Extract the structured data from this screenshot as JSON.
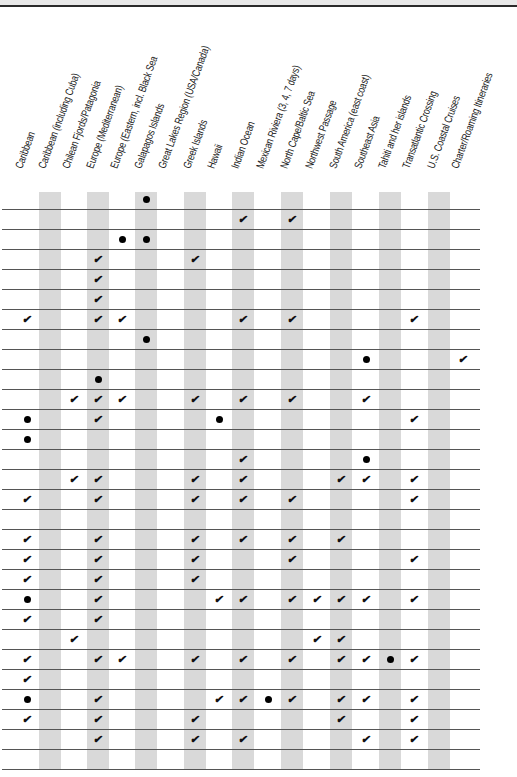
{
  "columns": [
    {
      "label": "Caribbean",
      "x": 27,
      "shaded": false
    },
    {
      "label": "Caribbean (including Cuba)",
      "x": 50,
      "shaded": true
    },
    {
      "label": "Chilean Fjords/Patagonia",
      "x": 74,
      "shaded": false
    },
    {
      "label": "Europe (Mediterranean)",
      "x": 98,
      "shaded": true
    },
    {
      "label": "Europe (Eastern, incl. Black Sea",
      "x": 122,
      "shaded": false
    },
    {
      "label": "Galapagos Islands",
      "x": 146,
      "shaded": true
    },
    {
      "label": "Great Lakes Region (USA/Canada)",
      "x": 170,
      "shaded": false
    },
    {
      "label": "Greek Islands",
      "x": 195,
      "shaded": true
    },
    {
      "label": "Hawaii",
      "x": 219,
      "shaded": false
    },
    {
      "label": "Indian Ocean",
      "x": 243,
      "shaded": true
    },
    {
      "label": "Mexican Riviera (3, 4, 7 days)",
      "x": 268,
      "shaded": false
    },
    {
      "label": "North Cape/Baltic Sea",
      "x": 292,
      "shaded": true
    },
    {
      "label": "Northwest Passage",
      "x": 317,
      "shaded": false
    },
    {
      "label": "South America (east coast)",
      "x": 341,
      "shaded": true
    },
    {
      "label": "Southeast Asia",
      "x": 366,
      "shaded": false
    },
    {
      "label": "Tahiti and her islands",
      "x": 390,
      "shaded": true
    },
    {
      "label": "Transatlantic Crossing",
      "x": 414,
      "shaded": false
    },
    {
      "label": "U.S. Coastal Cruises",
      "x": 439,
      "shaded": true
    },
    {
      "label": "Charter/Roaming Itineraries",
      "x": 463,
      "shaded": false
    }
  ],
  "legend_symbols": {
    "check": "✔",
    "dot": "●"
  },
  "rows": [
    {
      "cells": {
        "5": "dot"
      }
    },
    {
      "cells": {
        "9": "check",
        "11": "check"
      }
    },
    {
      "cells": {
        "4": "dot",
        "5": "dot"
      }
    },
    {
      "cells": {
        "3": "check",
        "7": "check"
      }
    },
    {
      "cells": {
        "3": "check"
      }
    },
    {
      "cells": {
        "3": "check"
      }
    },
    {
      "cells": {
        "0": "check",
        "3": "check",
        "4": "check",
        "9": "check",
        "11": "check",
        "16": "check"
      }
    },
    {
      "cells": {
        "5": "dot"
      }
    },
    {
      "cells": {
        "14": "dot",
        "18": "check"
      }
    },
    {
      "cells": {
        "3": "dot"
      }
    },
    {
      "cells": {
        "2": "check",
        "3": "check",
        "4": "check",
        "7": "check",
        "9": "check",
        "11": "check",
        "14": "check"
      }
    },
    {
      "cells": {
        "0": "dot",
        "3": "check",
        "8": "dot",
        "16": "check"
      }
    },
    {
      "cells": {
        "0": "dot"
      }
    },
    {
      "cells": {
        "9": "check",
        "14": "dot"
      }
    },
    {
      "cells": {
        "2": "check",
        "3": "check",
        "7": "check",
        "9": "check",
        "13": "check",
        "14": "check",
        "16": "check"
      }
    },
    {
      "cells": {
        "0": "check",
        "3": "check",
        "7": "check",
        "9": "check",
        "11": "check",
        "16": "check"
      }
    },
    {
      "cells": {}
    },
    {
      "cells": {
        "0": "check",
        "3": "check",
        "7": "check",
        "9": "check",
        "11": "check",
        "13": "check"
      }
    },
    {
      "cells": {
        "0": "check",
        "3": "check",
        "7": "check",
        "11": "check",
        "16": "check"
      }
    },
    {
      "cells": {
        "0": "check",
        "3": "check",
        "7": "check"
      }
    },
    {
      "cells": {
        "0": "dot",
        "3": "check",
        "8": "check",
        "9": "check",
        "11": "check",
        "12": "check",
        "13": "check",
        "14": "check",
        "16": "check"
      }
    },
    {
      "cells": {
        "0": "check",
        "3": "check"
      }
    },
    {
      "cells": {
        "2": "check",
        "12": "check",
        "13": "check"
      }
    },
    {
      "cells": {
        "0": "check",
        "3": "check",
        "4": "check",
        "7": "check",
        "9": "check",
        "11": "check",
        "13": "check",
        "14": "check",
        "15": "dot",
        "16": "check"
      }
    },
    {
      "cells": {
        "0": "check"
      }
    },
    {
      "cells": {
        "0": "dot",
        "3": "check",
        "8": "check",
        "9": "check",
        "10": "dot",
        "11": "check",
        "13": "check",
        "14": "check",
        "16": "check"
      }
    },
    {
      "cells": {
        "0": "check",
        "3": "check",
        "7": "check",
        "13": "check",
        "16": "check"
      }
    },
    {
      "cells": {
        "3": "check",
        "7": "check",
        "9": "check",
        "14": "check",
        "16": "check"
      }
    },
    {
      "cells": {}
    }
  ],
  "layout": {
    "first_row_center": 199,
    "row_height": 20,
    "stripe_color": "#d9d9d9",
    "line_color": "#555555"
  }
}
